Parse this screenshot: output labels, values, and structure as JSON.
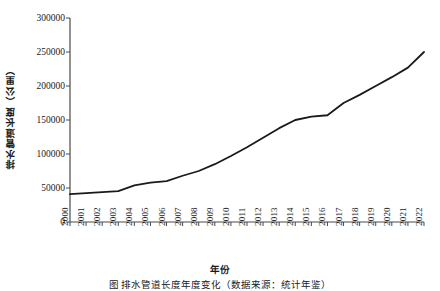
{
  "chart_data": {
    "type": "line",
    "title": "",
    "xlabel": "年份",
    "ylabel": "排水管道长度（公里）",
    "categories": [
      "2000",
      "2001",
      "2002",
      "2003",
      "2004",
      "2005",
      "2006",
      "2007",
      "2008",
      "2009",
      "2010",
      "2011",
      "2012",
      "2013",
      "2014",
      "2015",
      "2016",
      "2017",
      "2018",
      "2019",
      "2020",
      "2021",
      "2022"
    ],
    "x": [
      2000,
      2001,
      2002,
      2003,
      2004,
      2005,
      2006,
      2007,
      2008,
      2009,
      2010,
      2011,
      2012,
      2013,
      2014,
      2015,
      2016,
      2017,
      2018,
      2019,
      2020,
      2021,
      2022
    ],
    "values": [
      41000,
      42500,
      44000,
      45500,
      54000,
      58000,
      60000,
      68000,
      75000,
      85000,
      97000,
      110000,
      124000,
      138000,
      150000,
      155000,
      157000,
      175000,
      187000,
      200000,
      213000,
      227000,
      250000
    ],
    "ylim": [
      0,
      300000
    ],
    "yticks": [
      0,
      50000,
      100000,
      150000,
      200000,
      250000,
      300000
    ],
    "ytick_labels": [
      "0",
      "50000",
      "100000",
      "150000",
      "200000",
      "250000",
      "300000"
    ],
    "xlim": [
      2000,
      2022
    ],
    "grid": false,
    "legend": null,
    "line_color": "#1a1a1a",
    "line_width": 1.8,
    "markers": false
  },
  "figure": {
    "caption": "图 排水管道长度年度变化（数据来源：统计年鉴）",
    "background": "#ffffff",
    "axis_color": "#4a4a4a"
  },
  "axes": {
    "y_axis_title": "排水管道长度（公里）",
    "x_axis_title": "年份"
  }
}
